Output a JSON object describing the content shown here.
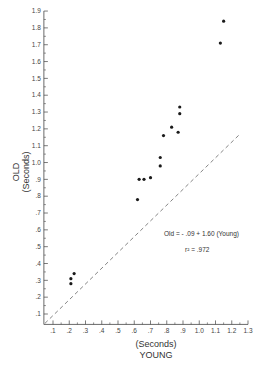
{
  "chart_data": {
    "type": "scatter",
    "title": "",
    "xlabel": "(Seconds)",
    "xlabel_main": "YOUNG",
    "ylabel": "OLD",
    "ylabel_units": "(Seconds)",
    "xlim": [
      0.05,
      1.3
    ],
    "ylim": [
      0.05,
      1.9
    ],
    "x_ticks": [
      ".1",
      ".2",
      ".3",
      ".4",
      ".5",
      ".6",
      ".7",
      ".8",
      ".9",
      "1.0",
      "1.1",
      "1.2",
      "1.3"
    ],
    "x_tick_values": [
      0.1,
      0.2,
      0.3,
      0.4,
      0.5,
      0.6,
      0.7,
      0.8,
      0.9,
      1.0,
      1.1,
      1.2,
      1.3
    ],
    "y_ticks": [
      ".1",
      ".2",
      ".3",
      ".4",
      ".5",
      ".6",
      ".7",
      ".8",
      ".9",
      "1.0",
      "1.1",
      "1.2",
      "1.3",
      "1.4",
      "1.5",
      "1.6",
      "1.7",
      "1.8",
      "1.9"
    ],
    "y_tick_values": [
      0.1,
      0.2,
      0.3,
      0.4,
      0.5,
      0.6,
      0.7,
      0.8,
      0.9,
      1.0,
      1.1,
      1.2,
      1.3,
      1.4,
      1.5,
      1.6,
      1.7,
      1.8,
      1.9
    ],
    "grid": false,
    "legend": null,
    "series": [
      {
        "name": "Old vs Young",
        "points": [
          {
            "x": 0.23,
            "y": 0.34
          },
          {
            "x": 0.21,
            "y": 0.31
          },
          {
            "x": 0.21,
            "y": 0.28
          },
          {
            "x": 0.62,
            "y": 0.78
          },
          {
            "x": 0.63,
            "y": 0.9
          },
          {
            "x": 0.66,
            "y": 0.9
          },
          {
            "x": 0.7,
            "y": 0.91
          },
          {
            "x": 0.76,
            "y": 0.98
          },
          {
            "x": 0.76,
            "y": 1.03
          },
          {
            "x": 0.78,
            "y": 1.16
          },
          {
            "x": 0.83,
            "y": 1.21
          },
          {
            "x": 0.87,
            "y": 1.18
          },
          {
            "x": 0.88,
            "y": 1.29
          },
          {
            "x": 0.88,
            "y": 1.33
          },
          {
            "x": 1.13,
            "y": 1.71
          },
          {
            "x": 1.15,
            "y": 1.84
          }
        ]
      }
    ],
    "reference_line": {
      "type": "identity",
      "style": "dashed",
      "from": [
        0.05,
        0.05
      ],
      "to": [
        1.3,
        1.3
      ]
    },
    "annotations": [
      {
        "text": "Old = -.09 + 1.60 (Young)",
        "x": 0.98,
        "y": 0.65
      },
      {
        "text": "r² = .972",
        "x": 1.05,
        "y": 0.57
      }
    ]
  },
  "labels": {
    "equation": "Old = - .09 + 1.60 (Young)",
    "r_squared": "r² = .972",
    "x_units": "(Seconds)",
    "x_name": "YOUNG",
    "y_name": "OLD",
    "y_units": "(Seconds)"
  },
  "colors": {
    "points": "#1a1a1a",
    "axis": "#444444",
    "reference_line": "#666666"
  }
}
